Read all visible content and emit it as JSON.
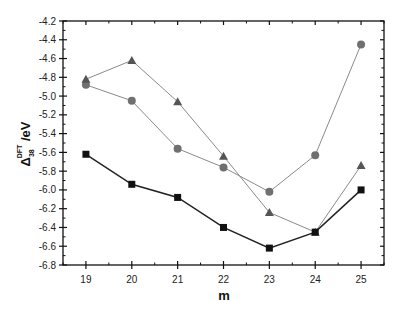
{
  "chart_data": {
    "type": "line",
    "title": "",
    "xlabel": "m",
    "ylabel": {
      "base": "Δ",
      "sub": "38",
      "sup": "DFT",
      "suffix": " /eV"
    },
    "xlim": [
      18.5,
      25.5
    ],
    "ylim": [
      -6.8,
      -4.2
    ],
    "x": [
      19,
      20,
      21,
      22,
      23,
      24,
      25
    ],
    "x_ticks": [
      "19",
      "20",
      "21",
      "22",
      "23",
      "24",
      "25"
    ],
    "y_ticks": [
      "-4.2",
      "-4.4",
      "-4.6",
      "-4.8",
      "-5.0",
      "-5.2",
      "-5.4",
      "-5.6",
      "-5.8",
      "-6.0",
      "-6.2",
      "-6.4",
      "-6.6",
      "-6.8"
    ],
    "grid": false,
    "legend": null,
    "series": [
      {
        "name": "squares",
        "marker": "square",
        "color": "#111111",
        "line_color": "#222222",
        "values": [
          -5.62,
          -5.94,
          -6.08,
          -6.4,
          -6.62,
          -6.45,
          -6.0
        ]
      },
      {
        "name": "circles",
        "marker": "circle",
        "color": "#707070",
        "line_color": "#8a8a8a",
        "values": [
          -4.88,
          -5.05,
          -5.56,
          -5.76,
          -6.02,
          -5.63,
          -4.45
        ]
      },
      {
        "name": "triangles",
        "marker": "triangle",
        "color": "#555555",
        "line_color": "#8a8a8a",
        "values": [
          -4.82,
          -4.62,
          -5.06,
          -5.64,
          -6.24,
          -6.45,
          -5.74
        ]
      }
    ]
  }
}
